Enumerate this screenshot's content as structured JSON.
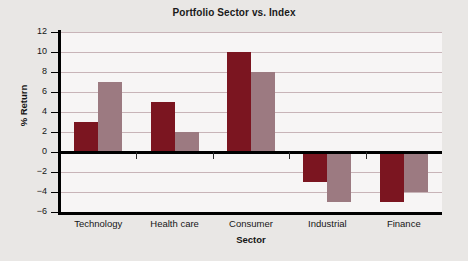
{
  "chart_data": {
    "type": "bar",
    "title": "Portfolio Sector vs. Index",
    "xlabel": "Sector",
    "ylabel": "% Return",
    "categories": [
      "Technology",
      "Health care",
      "Consumer",
      "Industrial",
      "Finance"
    ],
    "series": [
      {
        "name": "Portfolio",
        "color": "#7b1520",
        "values": [
          3,
          5,
          10,
          -3,
          -5
        ]
      },
      {
        "name": "Index",
        "color": "#9c7a81",
        "values": [
          7,
          2,
          8,
          -5,
          -4
        ]
      }
    ],
    "ylim": [
      -6,
      12
    ],
    "ytick_labels": [
      "12",
      "10",
      "8",
      "6",
      "4",
      "2",
      "0",
      "−2",
      "−4",
      "−6"
    ],
    "ytick_values": [
      12,
      10,
      8,
      6,
      4,
      2,
      0,
      -2,
      -4,
      -6
    ],
    "grid": true,
    "gridline_color": "#c8b4b8",
    "legend": "none",
    "plot_background": "#f7f5f5",
    "figure_background": "#e9e7e5",
    "axis_color": "#000000"
  }
}
